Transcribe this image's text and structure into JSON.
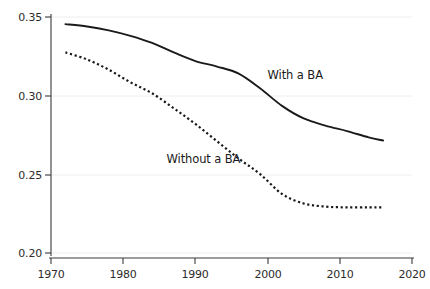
{
  "chart_data": {
    "type": "line",
    "title": "",
    "subtitle": "",
    "xlabel": "",
    "ylabel": "Fraction attending church weekly",
    "xlim": [
      1970,
      2020
    ],
    "ylim": [
      0.2,
      0.35
    ],
    "grid": true,
    "grid_axis": "y",
    "legend_position": "inline-annotation",
    "x_ticks": [
      1970,
      1980,
      1990,
      2000,
      2010,
      2020
    ],
    "x_tick_labels": [
      "1970",
      "1980",
      "1990",
      "2000",
      "2010",
      "2020"
    ],
    "y_ticks": [
      0.2,
      0.25,
      0.3,
      0.35
    ],
    "y_tick_labels": [
      "0.20",
      "0.25",
      "0.30",
      "0.35"
    ],
    "series": [
      {
        "name": "With a BA",
        "style": "solid",
        "color": "#1a1a1a",
        "x": [
          1972,
          1975,
          1978,
          1981,
          1984,
          1987,
          1990,
          1993,
          1996,
          1999,
          2002,
          2005,
          2008,
          2011,
          2014,
          2016
        ],
        "values": [
          0.3455,
          0.344,
          0.3415,
          0.338,
          0.3335,
          0.3275,
          0.322,
          0.3185,
          0.314,
          0.3045,
          0.2935,
          0.2855,
          0.281,
          0.2775,
          0.2735,
          0.2715
        ]
      },
      {
        "name": "Without a BA",
        "style": "dotted",
        "color": "#1a1a1a",
        "x": [
          1972,
          1975,
          1978,
          1981,
          1984,
          1987,
          1990,
          1993,
          1996,
          1999,
          2002,
          2005,
          2008,
          2011,
          2014,
          2016
        ],
        "values": [
          0.3275,
          0.323,
          0.3165,
          0.3085,
          0.3015,
          0.292,
          0.282,
          0.271,
          0.26,
          0.25,
          0.2375,
          0.2315,
          0.2295,
          0.229,
          0.229,
          0.229
        ]
      }
    ],
    "annotations": [
      {
        "text": "With a BA",
        "x": 2000,
        "y": 0.3125
      },
      {
        "text": "Without a BA",
        "x": 1986,
        "y": 0.259
      }
    ]
  },
  "axes": {
    "y_title": "Fraction attending church weekly"
  }
}
